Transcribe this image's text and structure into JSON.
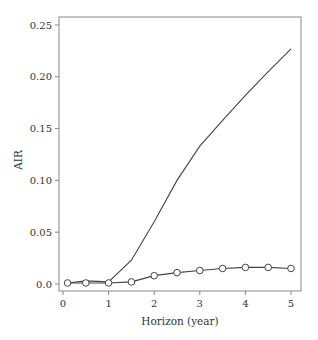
{
  "chart_data": {
    "type": "line",
    "title": "",
    "xlabel": "Horizon (year)",
    "ylabel": "AIR",
    "xlim": [
      0,
      5
    ],
    "ylim": [
      0,
      0.25
    ],
    "x_ticks": [
      0,
      1,
      2,
      3,
      4,
      5
    ],
    "x_tick_labels": [
      "0",
      "1",
      "2",
      "3",
      "4",
      "5"
    ],
    "y_ticks": [
      0,
      0.05,
      0.1,
      0.15,
      0.2,
      0.25
    ],
    "y_tick_labels": [
      "0.0",
      "0.05",
      "0.10",
      "0.15",
      "0.20",
      "0.25"
    ],
    "grid": false,
    "legend": null,
    "series": [
      {
        "name": "solid line (no markers)",
        "marker": "none",
        "x": [
          0.1,
          0.5,
          1.0,
          1.5,
          2.0,
          2.5,
          3.0,
          3.5,
          4.0,
          4.5,
          5.0
        ],
        "y": [
          0.001,
          0.003,
          0.002,
          0.023,
          0.06,
          0.1,
          0.133,
          0.158,
          0.182,
          0.205,
          0.227
        ]
      },
      {
        "name": "line with open circles",
        "marker": "open-circle",
        "x": [
          0.1,
          0.5,
          1.0,
          1.5,
          2.0,
          2.5,
          3.0,
          3.5,
          4.0,
          4.5,
          5.0
        ],
        "y": [
          0.001,
          0.001,
          0.001,
          0.002,
          0.008,
          0.011,
          0.013,
          0.015,
          0.016,
          0.016,
          0.015
        ]
      }
    ]
  },
  "colors": {
    "line": "#444444",
    "frame": "#888888",
    "marker_fill": "#ffffff"
  }
}
